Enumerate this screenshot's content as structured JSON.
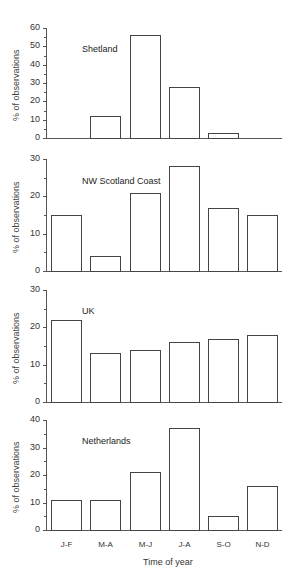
{
  "chart_data": [
    {
      "type": "bar",
      "title": "Shetland",
      "categories": [
        "J-F",
        "M-A",
        "M-J",
        "J-A",
        "S-O",
        "N-D"
      ],
      "values": [
        0,
        12,
        56,
        28,
        3,
        0
      ],
      "ylabel": "% of observations",
      "yticks": [
        "0",
        "10",
        "20",
        "30",
        "40",
        "50",
        "60"
      ],
      "ylim": [
        0,
        60
      ],
      "grid": false
    },
    {
      "type": "bar",
      "title": "NW Scotland Coast",
      "categories": [
        "J-F",
        "M-A",
        "M-J",
        "J-A",
        "S-O",
        "N-D"
      ],
      "values": [
        15,
        4,
        21,
        28,
        17,
        15
      ],
      "ylabel": "% of observations",
      "yticks": [
        "0",
        "10",
        "20",
        "30"
      ],
      "ylim": [
        0,
        30
      ],
      "grid": false
    },
    {
      "type": "bar",
      "title": "UK",
      "categories": [
        "J-F",
        "M-A",
        "M-J",
        "J-A",
        "S-O",
        "N-D"
      ],
      "values": [
        22,
        13,
        14,
        16,
        17,
        18
      ],
      "ylabel": "% of observations",
      "yticks": [
        "0",
        "10",
        "20",
        "30"
      ],
      "ylim": [
        0,
        30
      ],
      "grid": false
    },
    {
      "type": "bar",
      "title": "Netherlands",
      "categories": [
        "J-F",
        "M-A",
        "M-J",
        "J-A",
        "S-O",
        "N-D"
      ],
      "values": [
        11,
        11,
        21,
        37,
        5,
        16
      ],
      "ylabel": "% of observations",
      "xlabel": "Time of year",
      "yticks": [
        "0",
        "10",
        "20",
        "30",
        "40"
      ],
      "ylim": [
        0,
        40
      ],
      "grid": false
    }
  ],
  "panels": [
    {
      "title": "Shetland",
      "ylabel": "% of observations"
    },
    {
      "title": "NW Scotland Coast",
      "ylabel": "% of observations"
    },
    {
      "title": "UK",
      "ylabel": "% of observations"
    },
    {
      "title": "Netherlands",
      "ylabel": "% of observations"
    }
  ],
  "xaxis": {
    "categories": [
      "J-F",
      "M-A",
      "M-J",
      "J-A",
      "S-O",
      "N-D"
    ],
    "title": "Time of year"
  }
}
